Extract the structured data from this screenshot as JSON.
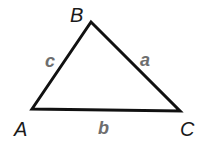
{
  "diagram": {
    "type": "triangle",
    "vertices": [
      {
        "id": "A",
        "label": "A",
        "x": 32,
        "y": 109,
        "label_x": 14,
        "label_y": 136
      },
      {
        "id": "B",
        "label": "B",
        "x": 91,
        "y": 22,
        "label_x": 70,
        "label_y": 22
      },
      {
        "id": "C",
        "label": "C",
        "x": 180,
        "y": 111,
        "label_x": 180,
        "label_y": 136
      }
    ],
    "sides": [
      {
        "id": "a",
        "label": "a",
        "from": "B",
        "to": "C",
        "label_x": 140,
        "label_y": 66
      },
      {
        "id": "b",
        "label": "b",
        "from": "A",
        "to": "C",
        "label_x": 98,
        "label_y": 134
      },
      {
        "id": "c",
        "label": "c",
        "from": "A",
        "to": "B",
        "label_x": 45,
        "label_y": 67
      }
    ],
    "colors": {
      "stroke": "#111111",
      "vertex_label": "#1a1a1a",
      "side_label": "#6e6e6e"
    }
  }
}
